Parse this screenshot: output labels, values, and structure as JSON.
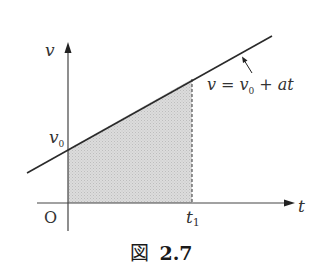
{
  "figure": {
    "caption_prefix": "図",
    "caption_number": "2.7"
  },
  "axes": {
    "x_label": "t",
    "y_label": "v",
    "origin_label": "O"
  },
  "labels": {
    "v0": "v",
    "v0_sub": "0",
    "t1": "t",
    "t1_sub": "1",
    "equation_v": "v",
    "equation_eq": "=",
    "equation_v0": "v",
    "equation_v0_sub": "0",
    "equation_plus": "+",
    "equation_at": "at"
  },
  "colors": {
    "line": "#2a2a2a",
    "shade": "#d4d4d4",
    "axis": "#444444"
  }
}
